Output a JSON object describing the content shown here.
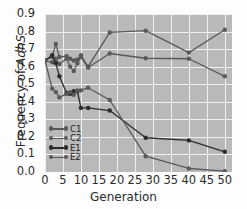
{
  "chart_data": {
    "type": "line",
    "title": "",
    "xlabel": "Generation",
    "ylabel": "Frequency of AdhS",
    "ylabel_plain": "Frequency of ",
    "ylabel_italic": "AdhS",
    "xlim": [
      0,
      52
    ],
    "ylim": [
      0.0,
      0.9
    ],
    "xticks": [
      0,
      5,
      10,
      15,
      20,
      25,
      30,
      35,
      40,
      45,
      50
    ],
    "yticks": [
      "0.0",
      "0.1",
      "0.2",
      "0.3",
      "0.4",
      "0.5",
      "0.6",
      "0.7",
      "0.8",
      "0.9"
    ],
    "grid": true,
    "legend_position": "lower-left-inside",
    "plot_background": "#b9b9b9",
    "grid_color": "#efefef",
    "series": [
      {
        "name": "C1",
        "color": "#595959",
        "x": [
          0,
          2,
          3,
          4,
          6,
          7,
          8,
          9,
          10,
          12,
          18,
          28,
          40,
          50
        ],
        "y": [
          0.635,
          0.655,
          0.73,
          0.655,
          0.66,
          0.645,
          0.635,
          0.64,
          0.665,
          0.6,
          0.795,
          0.805,
          0.68,
          0.81
        ]
      },
      {
        "name": "C2",
        "color": "#595959",
        "x": [
          0,
          2,
          3,
          4,
          6,
          7,
          8,
          9,
          10,
          12,
          18,
          28,
          40,
          50
        ],
        "y": [
          0.635,
          0.625,
          0.645,
          0.615,
          0.645,
          0.6,
          0.575,
          0.62,
          0.655,
          0.595,
          0.675,
          0.648,
          0.645,
          0.545
        ]
      },
      {
        "name": "E1",
        "color": "#2b2b2b",
        "x": [
          0,
          2,
          3,
          4,
          6,
          7,
          8,
          9,
          10,
          12,
          18,
          28,
          40,
          50
        ],
        "y": [
          0.635,
          0.665,
          0.62,
          0.545,
          0.45,
          0.445,
          0.46,
          0.46,
          0.365,
          0.365,
          0.35,
          0.195,
          0.18,
          0.115
        ]
      },
      {
        "name": "E2",
        "color": "#595959",
        "x": [
          0,
          2,
          3,
          4,
          6,
          7,
          8,
          9,
          10,
          12,
          18,
          28,
          40,
          50
        ],
        "y": [
          0.635,
          0.475,
          0.455,
          0.425,
          0.445,
          0.455,
          0.44,
          0.465,
          0.465,
          0.48,
          0.41,
          0.09,
          0.02,
          0.005
        ]
      }
    ]
  },
  "legend": {
    "items": [
      {
        "label": "C1",
        "color": "#595959"
      },
      {
        "label": "C2",
        "color": "#595959"
      },
      {
        "label": "E1",
        "color": "#2b2b2b"
      },
      {
        "label": "E2",
        "color": "#595959"
      }
    ]
  }
}
